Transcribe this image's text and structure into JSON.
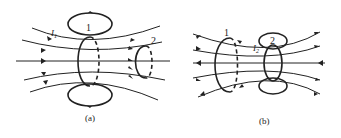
{
  "figure_a": {
    "caption": "(a)",
    "coil1_label": "1",
    "coil2_label": "2",
    "current_label": "I",
    "current_sub": "1"
  },
  "figure_b": {
    "caption": "(b)",
    "coil1_label": "1",
    "coil2_label": "2",
    "current_label": "I",
    "current_sub": "2"
  }
}
